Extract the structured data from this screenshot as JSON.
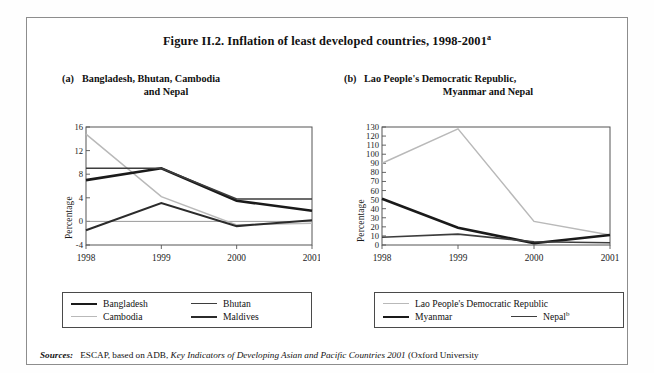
{
  "figure": {
    "title_main": "Figure II.2.  Inflation of least developed countries, 1998-2001",
    "title_superscript": "a",
    "ylabel": "Percentage"
  },
  "panels": [
    {
      "tag": "(a)",
      "caption_line1": "Bangladesh, Bhutan, Cambodia",
      "caption_line2": "and Nepal"
    },
    {
      "tag": "(b)",
      "caption_line1": "Lao People's Democratic Republic,",
      "caption_line2": "Myanmar and Nepal"
    }
  ],
  "legend_left": {
    "items": [
      {
        "label": "Bangladesh",
        "color": "#1a1a1a",
        "width": 2.6
      },
      {
        "label": "Bhutan",
        "color": "#3d3d3d",
        "width": 1.6
      },
      {
        "label": "Cambodia",
        "color": "#b9b9b9",
        "width": 1.5
      },
      {
        "label": "Maldives",
        "color": "#2b2b2b",
        "width": 2.0
      }
    ]
  },
  "legend_right": {
    "items": [
      {
        "label": "Lao People's Democratic Republic",
        "color": "#b9b9b9",
        "width": 1.5
      },
      {
        "label": "Myanmar",
        "color": "#1a1a1a",
        "width": 2.6
      },
      {
        "label": "Nepal",
        "superscript": "b",
        "color": "#3d3d3d",
        "width": 1.6
      }
    ]
  },
  "source": {
    "label": "Sources:",
    "text_before": "ESCAP, based on ADB,",
    "italic_title": "Key Indicators of Developing Asian and Pacific Countries 2001",
    "text_after": "(Oxford University"
  },
  "chart_data": [
    {
      "type": "line",
      "title": "(a) Bangladesh, Bhutan, Cambodia and Nepal",
      "xlabel": "",
      "ylabel": "Percentage",
      "categories": [
        "1998",
        "1999",
        "2000",
        "2001"
      ],
      "ylim": [
        -4,
        16
      ],
      "yticks": [
        -4,
        0,
        4,
        8,
        12,
        16
      ],
      "grid": false,
      "legend_position": "bottom",
      "series": [
        {
          "name": "Bangladesh",
          "color": "#1a1a1a",
          "width": 2.6,
          "values": [
            7.0,
            9.0,
            3.5,
            1.8
          ]
        },
        {
          "name": "Bhutan",
          "color": "#3d3d3d",
          "width": 1.6,
          "values": [
            9.0,
            9.0,
            3.8,
            3.8
          ]
        },
        {
          "name": "Cambodia",
          "color": "#b9b9b9",
          "width": 1.5,
          "values": [
            14.8,
            4.2,
            -0.6,
            -0.3
          ]
        },
        {
          "name": "Maldives",
          "color": "#2b2b2b",
          "width": 2.0,
          "values": [
            -1.5,
            3.1,
            -0.8,
            0.2
          ]
        }
      ]
    },
    {
      "type": "line",
      "title": "(b) Lao People's Democratic Republic, Myanmar and Nepal",
      "xlabel": "",
      "ylabel": "Percentage",
      "categories": [
        "1998",
        "1999",
        "2000",
        "2001"
      ],
      "ylim": [
        0,
        130
      ],
      "yticks": [
        0,
        10,
        20,
        30,
        40,
        50,
        60,
        70,
        80,
        90,
        100,
        110,
        120,
        130
      ],
      "grid": false,
      "legend_position": "bottom",
      "series": [
        {
          "name": "Lao People's Democratic Republic",
          "color": "#b9b9b9",
          "width": 1.5,
          "values": [
            90,
            128,
            26,
            11
          ]
        },
        {
          "name": "Myanmar",
          "color": "#1a1a1a",
          "width": 2.6,
          "values": [
            51,
            19,
            2,
            11
          ]
        },
        {
          "name": "Nepal",
          "color": "#3d3d3d",
          "width": 1.6,
          "values": [
            8.5,
            12,
            3.5,
            2.5
          ]
        }
      ]
    }
  ]
}
